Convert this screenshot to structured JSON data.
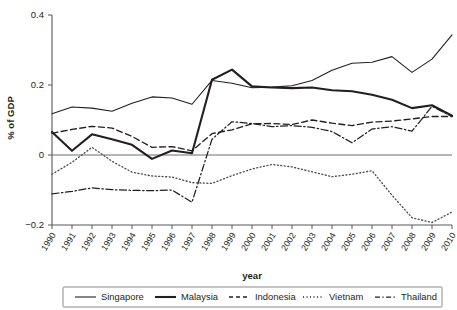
{
  "chart_data": {
    "type": "line",
    "title": "",
    "xlabel": "year",
    "ylabel": "% of GDP",
    "xlim": [
      1990,
      2010
    ],
    "ylim": [
      -0.2,
      0.4
    ],
    "yticks": [
      0.4,
      0.2,
      0,
      -0.2
    ],
    "ytick_labels": [
      "0.4",
      "0.2",
      "0",
      "−0.2"
    ],
    "grid": false,
    "legend_position": "bottom",
    "x": [
      1990,
      1991,
      1992,
      1993,
      1994,
      1995,
      1996,
      1997,
      1998,
      1999,
      2000,
      2001,
      2002,
      2003,
      2004,
      2005,
      2006,
      2007,
      2008,
      2009,
      2010
    ],
    "xtick_labels": [
      "1990",
      "1991",
      "1992",
      "1993",
      "1994",
      "1995",
      "1996",
      "1997",
      "1998",
      "1999",
      "2000",
      "2001",
      "2002",
      "2003",
      "2004",
      "2005",
      "2006",
      "2007",
      "2008",
      "2009",
      "2010"
    ],
    "series": [
      {
        "name": "Singapore",
        "style": "solid-thin",
        "values": [
          0.118,
          0.137,
          0.134,
          0.125,
          0.148,
          0.166,
          0.163,
          0.145,
          0.213,
          0.205,
          0.192,
          0.194,
          0.198,
          0.213,
          0.242,
          0.262,
          0.265,
          0.281,
          0.236,
          0.274,
          0.343
        ]
      },
      {
        "name": "Malaysia",
        "style": "solid-thick",
        "values": [
          0.066,
          0.012,
          0.059,
          0.045,
          0.029,
          -0.011,
          0.013,
          0.005,
          0.215,
          0.244,
          0.196,
          0.193,
          0.191,
          0.193,
          0.185,
          0.182,
          0.172,
          0.158,
          0.134,
          0.142,
          0.112
        ]
      },
      {
        "name": "Indonesia",
        "style": "dashed",
        "values": [
          0.062,
          0.073,
          0.082,
          0.077,
          0.053,
          0.022,
          0.024,
          0.012,
          0.061,
          0.072,
          0.089,
          0.09,
          0.087,
          0.1,
          0.091,
          0.084,
          0.094,
          0.097,
          0.103,
          0.11,
          0.11
        ]
      },
      {
        "name": "Vietnam",
        "style": "dotted",
        "values": [
          -0.055,
          -0.021,
          0.022,
          -0.018,
          -0.049,
          -0.06,
          -0.063,
          -0.079,
          -0.081,
          -0.059,
          -0.04,
          -0.027,
          -0.034,
          -0.048,
          -0.062,
          -0.055,
          -0.045,
          -0.115,
          -0.179,
          -0.193,
          -0.163
        ]
      },
      {
        "name": "Thailand",
        "style": "dash-dot",
        "values": [
          -0.111,
          -0.104,
          -0.094,
          -0.099,
          -0.101,
          -0.102,
          -0.1,
          -0.135,
          0.045,
          0.095,
          0.09,
          0.081,
          0.084,
          0.079,
          0.067,
          0.035,
          0.074,
          0.081,
          0.068,
          0.139,
          0.11
        ]
      }
    ]
  },
  "legend": {
    "items": [
      {
        "label": "Singapore",
        "style": "solid-thin"
      },
      {
        "label": "Malaysia",
        "style": "solid-thick"
      },
      {
        "label": "Indonesia",
        "style": "dashed"
      },
      {
        "label": "Vietnam",
        "style": "dotted"
      },
      {
        "label": "Thailand",
        "style": "dash-dot"
      }
    ]
  }
}
